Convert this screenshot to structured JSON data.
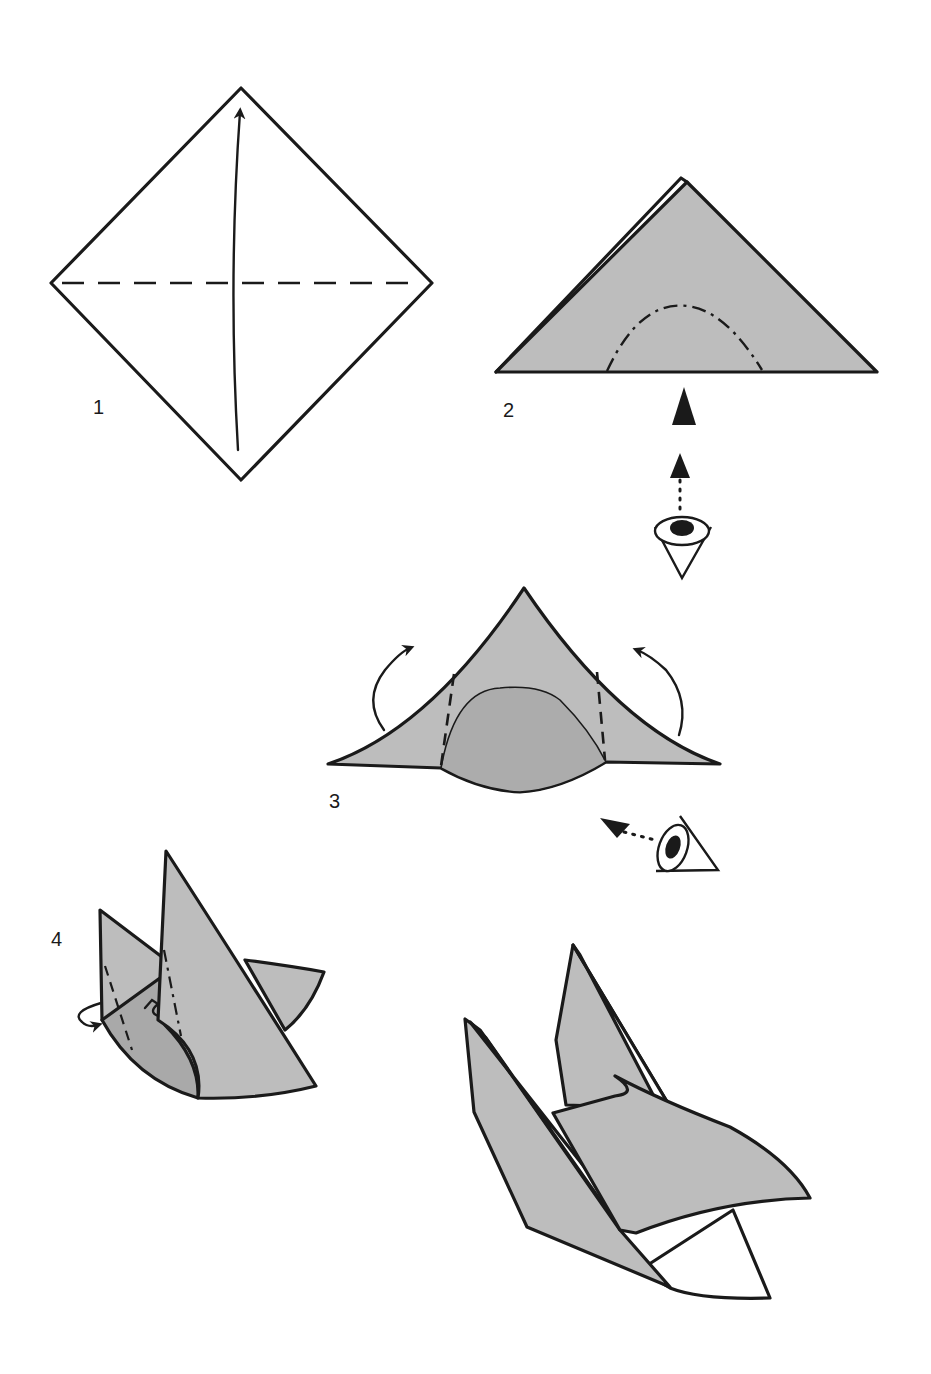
{
  "diagram": {
    "type": "origami-instructions",
    "colors": {
      "paper": "#bdbdbd",
      "paper_shadow": "#a9a9a9",
      "line": "#1a1a1a",
      "background": "#ffffff"
    },
    "steps": [
      {
        "number": "1",
        "description": "Square diamond with horizontal valley-fold line; arrow folds bottom corner up to top"
      },
      {
        "number": "2",
        "description": "Folded triangle with curved mountain-fold (dash-dot) arc; view-direction symbol from below"
      },
      {
        "number": "3",
        "description": "Rounded base pushed in; two dashed vertical fold lines; side flaps folded up and back; eye view from side"
      },
      {
        "number": "4",
        "description": "Three-dimensional form with dash and dash-dot fold lines; curled arrow at left side"
      },
      {
        "number": "",
        "description": "Finished model"
      }
    ],
    "symbols": [
      "valley-fold-line",
      "mountain-fold-line",
      "fold-arrow",
      "eye-view-symbol",
      "push-arrow"
    ]
  }
}
